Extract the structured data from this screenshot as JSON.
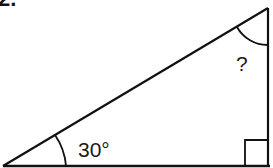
{
  "problem": {
    "number_label": "2."
  },
  "diagram": {
    "type": "right-triangle",
    "stroke_color": "#111111",
    "vertices": {
      "left": [
        3,
        166
      ],
      "top": [
        268,
        8
      ],
      "right_angle": [
        268,
        166
      ]
    },
    "angles": {
      "known": "30°",
      "unknown": "?"
    }
  }
}
